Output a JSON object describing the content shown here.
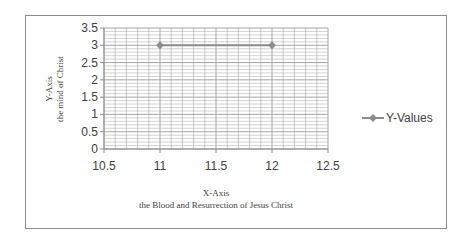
{
  "chart_data": {
    "type": "scatter",
    "title": "",
    "xlabel": "X-Axis\nthe Blood and Resurrection of Jesus Christ",
    "xlabel_lines": [
      "X-Axis",
      "the Blood and Resurrection of Jesus Christ"
    ],
    "ylabel": "Y-Axis\nthe mind of Christ",
    "ylabel_lines": [
      "Y-Axis",
      "the mind of Christ"
    ],
    "xlim": [
      10.5,
      12.5
    ],
    "ylim": [
      0,
      3.5
    ],
    "x_ticks": [
      "10.5",
      "11",
      "11.5",
      "12",
      "12.5"
    ],
    "y_ticks": [
      "0",
      "0.5",
      "1",
      "1.5",
      "2",
      "2.5",
      "3",
      "3.5"
    ],
    "grid": true,
    "legend_position": "right",
    "series": [
      {
        "name": "Y-Values",
        "x": [
          11,
          12
        ],
        "values": [
          3,
          3
        ],
        "style": "line-with-markers",
        "color": "#8c8c8c"
      }
    ]
  },
  "legend": {
    "label": "Y-Values"
  },
  "colors": {
    "series": "#8c8c8c",
    "grid": "#a6a6a6",
    "border": "#8c8c8c"
  }
}
